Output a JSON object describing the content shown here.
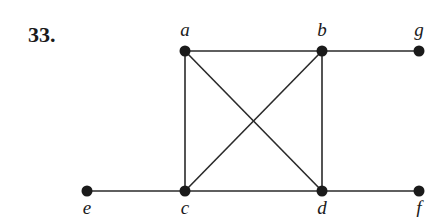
{
  "problem": {
    "number": "33."
  },
  "graph": {
    "vertices": [
      {
        "id": "a",
        "label": "a",
        "x": 185,
        "y": 51,
        "label_x": 185,
        "label_y": 36
      },
      {
        "id": "b",
        "label": "b",
        "x": 322,
        "y": 51,
        "label_x": 322,
        "label_y": 36
      },
      {
        "id": "g",
        "label": "g",
        "x": 419,
        "y": 51,
        "label_x": 419,
        "label_y": 36
      },
      {
        "id": "e",
        "label": "e",
        "x": 87,
        "y": 191,
        "label_x": 87,
        "label_y": 214
      },
      {
        "id": "c",
        "label": "c",
        "x": 185,
        "y": 191,
        "label_x": 185,
        "label_y": 214
      },
      {
        "id": "d",
        "label": "d",
        "x": 322,
        "y": 191,
        "label_x": 322,
        "label_y": 214
      },
      {
        "id": "f",
        "label": "f",
        "x": 419,
        "y": 191,
        "label_x": 419,
        "label_y": 214
      }
    ],
    "edges": [
      [
        "a",
        "b"
      ],
      [
        "b",
        "g"
      ],
      [
        "a",
        "c"
      ],
      [
        "b",
        "d"
      ],
      [
        "a",
        "d"
      ],
      [
        "b",
        "c"
      ],
      [
        "e",
        "c"
      ],
      [
        "c",
        "d"
      ],
      [
        "d",
        "f"
      ]
    ]
  }
}
